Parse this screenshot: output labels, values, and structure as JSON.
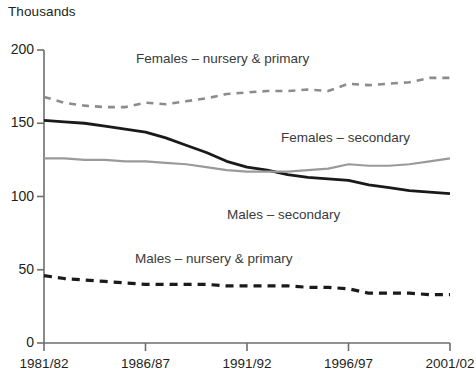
{
  "chart_data": {
    "type": "line",
    "title": "",
    "subtitle": "",
    "unit_label": "Thousands",
    "xlabel": "",
    "ylabel": "",
    "grid": false,
    "legend_position": "inline-annotations",
    "xlim": [
      1981,
      2001
    ],
    "ylim": [
      0,
      200
    ],
    "y_ticks": [
      0,
      50,
      100,
      150,
      200
    ],
    "x_ticks": [
      "1981/82",
      "1986/87",
      "1991/92",
      "1996/97",
      "2001/02"
    ],
    "x": [
      1981,
      1982,
      1983,
      1984,
      1985,
      1986,
      1987,
      1988,
      1989,
      1990,
      1991,
      1992,
      1993,
      1994,
      1995,
      1996,
      1997,
      1998,
      1999,
      2000,
      2001
    ],
    "x_full_labels": [
      "1981/82",
      "1982/83",
      "1983/84",
      "1984/85",
      "1985/86",
      "1986/87",
      "1987/88",
      "1988/89",
      "1989/90",
      "1990/91",
      "1991/92",
      "1992/93",
      "1993/94",
      "1994/95",
      "1995/96",
      "1996/97",
      "1997/98",
      "1998/99",
      "1999/00",
      "2000/01",
      "2001/02"
    ],
    "series": [
      {
        "name": "Females – nursery & primary",
        "style": "dashed",
        "color": "#8c8c8c",
        "values": [
          168,
          164,
          162,
          161,
          161,
          164,
          163,
          165,
          167,
          170,
          171,
          172,
          172,
          173,
          172,
          177,
          176,
          177,
          178,
          181,
          181
        ]
      },
      {
        "name": "Males – secondary",
        "style": "solid",
        "color": "#1a1a1a",
        "values": [
          152,
          151,
          150,
          148,
          146,
          144,
          140,
          135,
          130,
          124,
          120,
          118,
          115,
          113,
          112,
          111,
          108,
          106,
          104,
          103,
          102
        ]
      },
      {
        "name": "Females – secondary",
        "style": "solid",
        "color": "#9a9a9a",
        "values": [
          126,
          126,
          125,
          125,
          124,
          124,
          123,
          122,
          120,
          118,
          117,
          117,
          117,
          118,
          119,
          122,
          121,
          121,
          122,
          124,
          126
        ]
      },
      {
        "name": "Males – nursery & primary",
        "style": "dashed",
        "color": "#1a1a1a",
        "values": [
          46,
          44,
          43,
          42,
          41,
          40,
          40,
          40,
          40,
          39,
          39,
          39,
          39,
          38,
          38,
          37,
          34,
          34,
          34,
          33,
          33
        ]
      }
    ],
    "annotations": [
      {
        "text": "Females – nursery & primary",
        "x_px": 136,
        "y_px": 52
      },
      {
        "text": "Females – secondary",
        "x_px": 281,
        "y_px": 131
      },
      {
        "text": "Males – secondary",
        "x_px": 227,
        "y_px": 208
      },
      {
        "text": "Males – nursery & primary",
        "x_px": 135,
        "y_px": 252
      }
    ],
    "colors": {
      "axis": "#6e6e6e",
      "text": "#231f20",
      "annotation": "#3a3a3a",
      "background": "#ffffff"
    }
  }
}
